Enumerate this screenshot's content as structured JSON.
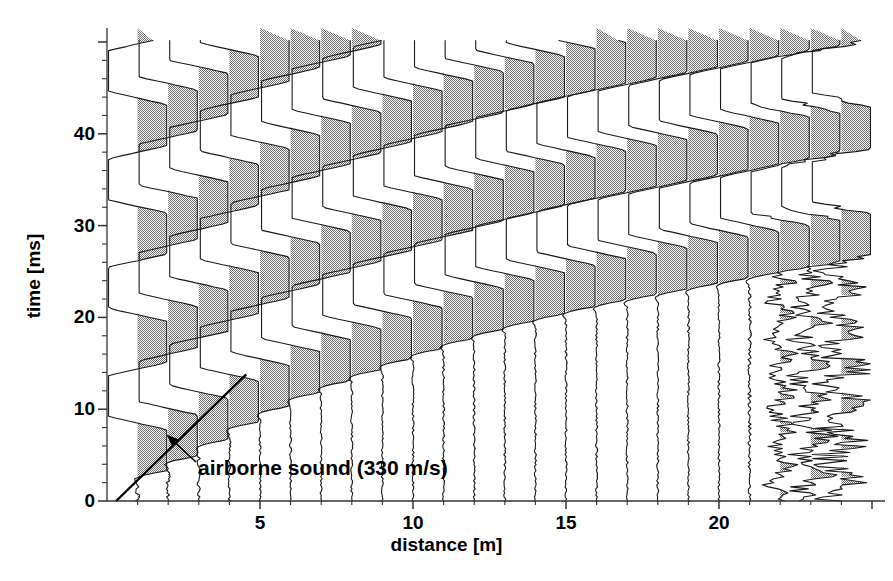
{
  "figure": {
    "kind": "seismic-wiggle-trace-plot",
    "background": "#ffffff",
    "ink": "#000000",
    "fill_gray": "#808080"
  },
  "axes": {
    "x": {
      "label": "distance [m]",
      "tick_labels": [
        "5",
        "10",
        "15",
        "20"
      ],
      "tick_values": [
        5,
        10,
        15,
        20
      ],
      "minor_step": 1,
      "range": [
        0.3,
        25.2
      ],
      "pixel_origin_x": 107,
      "pixel_per_unit": 30.6
    },
    "y": {
      "label": "time [ms]",
      "tick_labels": [
        "0",
        "10",
        "20",
        "30",
        "40"
      ],
      "tick_values": [
        0,
        10,
        20,
        30,
        40
      ],
      "minor_step": 2,
      "range": [
        0,
        50
      ],
      "pixel_origin_y": 501,
      "pixel_per_unit": 9.18,
      "direction": "up"
    }
  },
  "annotations": [
    {
      "name": "airborne-sound",
      "text": "airborne sound (330 m/s)",
      "text_x": 198,
      "text_y": 456,
      "arrow_from": [
        196,
        462
      ],
      "arrow_to": [
        168,
        436
      ],
      "line": {
        "velocity_m_per_s": 330,
        "from_m_ms": [
          0.3,
          0.0
        ],
        "to_m_ms": [
          4.55,
          13.8
        ]
      }
    }
  ],
  "chart_data": {
    "type": "line",
    "title": "",
    "xlabel": "distance [m]",
    "ylabel": "time [ms]",
    "xlim": [
      0.3,
      25.2
    ],
    "ylim": [
      0,
      50
    ],
    "grid": false,
    "legend": "none",
    "trace_spacing_m": 1,
    "clip_amplitude_m": 0.95,
    "traces": [
      {
        "offset_m": 1,
        "first_break_ms": 2.0,
        "period_ms": 11.8,
        "clip": 0.95,
        "phase_deg": 0,
        "decay": 0.0,
        "noise": 0.06
      },
      {
        "offset_m": 2,
        "first_break_ms": 3.6,
        "period_ms": 11.8,
        "clip": 0.95,
        "phase_deg": 0,
        "decay": 0.0,
        "noise": 0.06
      },
      {
        "offset_m": 3,
        "first_break_ms": 5.4,
        "period_ms": 11.8,
        "clip": 0.95,
        "phase_deg": 0,
        "decay": 0.0,
        "noise": 0.05
      },
      {
        "offset_m": 4,
        "first_break_ms": 7.3,
        "period_ms": 11.8,
        "clip": 0.95,
        "phase_deg": 0,
        "decay": 0.0,
        "noise": 0.04
      },
      {
        "offset_m": 5,
        "first_break_ms": 9.0,
        "period_ms": 11.8,
        "clip": 0.95,
        "phase_deg": 0,
        "decay": 0.0,
        "noise": 0.03
      },
      {
        "offset_m": 6,
        "first_break_ms": 10.5,
        "period_ms": 11.8,
        "clip": 0.95,
        "phase_deg": 0,
        "decay": 0.0,
        "noise": 0.03
      },
      {
        "offset_m": 7,
        "first_break_ms": 11.8,
        "period_ms": 11.8,
        "clip": 0.95,
        "phase_deg": 0,
        "decay": 0.0,
        "noise": 0.03
      },
      {
        "offset_m": 8,
        "first_break_ms": 13.0,
        "period_ms": 11.8,
        "clip": 0.95,
        "phase_deg": 0,
        "decay": 0.0,
        "noise": 0.03
      },
      {
        "offset_m": 9,
        "first_break_ms": 14.2,
        "period_ms": 11.8,
        "clip": 0.95,
        "phase_deg": 0,
        "decay": 0.0,
        "noise": 0.03
      },
      {
        "offset_m": 10,
        "first_break_ms": 15.3,
        "period_ms": 11.8,
        "clip": 0.95,
        "phase_deg": 0,
        "decay": 0.0,
        "noise": 0.03
      },
      {
        "offset_m": 11,
        "first_break_ms": 16.4,
        "period_ms": 11.8,
        "clip": 0.95,
        "phase_deg": 0,
        "decay": 0.0,
        "noise": 0.03
      },
      {
        "offset_m": 12,
        "first_break_ms": 17.4,
        "period_ms": 11.8,
        "clip": 0.95,
        "phase_deg": 0,
        "decay": 0.0,
        "noise": 0.03
      },
      {
        "offset_m": 13,
        "first_break_ms": 18.3,
        "period_ms": 11.8,
        "clip": 0.95,
        "phase_deg": 0,
        "decay": 0.0,
        "noise": 0.03
      },
      {
        "offset_m": 14,
        "first_break_ms": 19.1,
        "period_ms": 11.8,
        "clip": 0.95,
        "phase_deg": 0,
        "decay": 0.0,
        "noise": 0.03
      },
      {
        "offset_m": 15,
        "first_break_ms": 19.9,
        "period_ms": 11.8,
        "clip": 0.95,
        "phase_deg": 0,
        "decay": 0.0,
        "noise": 0.03
      },
      {
        "offset_m": 16,
        "first_break_ms": 20.6,
        "period_ms": 11.8,
        "clip": 0.95,
        "phase_deg": 0,
        "decay": 0.0,
        "noise": 0.03
      },
      {
        "offset_m": 17,
        "first_break_ms": 21.2,
        "period_ms": 11.8,
        "clip": 0.95,
        "phase_deg": 0,
        "decay": 0.0,
        "noise": 0.03
      },
      {
        "offset_m": 18,
        "first_break_ms": 21.8,
        "period_ms": 11.8,
        "clip": 0.95,
        "phase_deg": 0,
        "decay": 0.0,
        "noise": 0.03
      },
      {
        "offset_m": 19,
        "first_break_ms": 22.4,
        "period_ms": 11.8,
        "clip": 0.95,
        "phase_deg": 0,
        "decay": 0.0,
        "noise": 0.03
      },
      {
        "offset_m": 20,
        "first_break_ms": 23.0,
        "period_ms": 11.8,
        "clip": 0.95,
        "phase_deg": 0,
        "decay": 0.0,
        "noise": 0.03
      },
      {
        "offset_m": 21,
        "first_break_ms": 23.6,
        "period_ms": 11.8,
        "clip": 0.95,
        "phase_deg": 0,
        "decay": 0.0,
        "noise": 0.05
      },
      {
        "offset_m": 22,
        "first_break_ms": 24.2,
        "period_ms": 11.8,
        "clip": 0.95,
        "phase_deg": 0,
        "decay": 0.0,
        "noise": 0.3
      },
      {
        "offset_m": 23,
        "first_break_ms": 24.8,
        "period_ms": 11.8,
        "clip": 0.95,
        "phase_deg": 0,
        "decay": 0.0,
        "noise": 0.45
      },
      {
        "offset_m": 24,
        "first_break_ms": 25.4,
        "period_ms": 11.8,
        "clip": 0.95,
        "phase_deg": 0,
        "decay": 0.0,
        "noise": 0.6
      }
    ]
  }
}
